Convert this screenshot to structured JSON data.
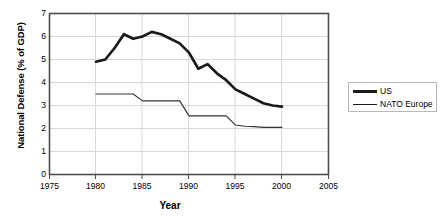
{
  "chart_data": {
    "type": "line",
    "title": "",
    "xlabel": "Year",
    "ylabel": "National Defense (% of GDP)",
    "xlim": [
      1975,
      2005
    ],
    "ylim": [
      0,
      7
    ],
    "xticks": [
      1975,
      1980,
      1985,
      1990,
      1995,
      2000,
      2005
    ],
    "yticks": [
      0,
      1,
      2,
      3,
      4,
      5,
      6,
      7
    ],
    "grid": true,
    "legend_position": "right",
    "x": [
      1980,
      1981,
      1982,
      1983,
      1984,
      1985,
      1986,
      1987,
      1988,
      1989,
      1990,
      1991,
      1992,
      1993,
      1994,
      1995,
      1996,
      1997,
      1998,
      1999,
      2000
    ],
    "series": [
      {
        "name": "US",
        "style": "thick",
        "color": "#1a1a1a",
        "values": [
          4.9,
          5.0,
          5.5,
          6.1,
          5.9,
          6.0,
          6.2,
          6.1,
          5.9,
          5.7,
          5.3,
          4.6,
          4.8,
          4.4,
          4.1,
          3.7,
          3.5,
          3.3,
          3.1,
          3.0,
          2.95
        ]
      },
      {
        "name": "NATO Europe",
        "style": "thin",
        "color": "#333333",
        "values": [
          3.5,
          3.5,
          3.5,
          3.5,
          3.5,
          3.2,
          3.2,
          3.2,
          3.2,
          3.2,
          2.55,
          2.55,
          2.55,
          2.55,
          2.55,
          2.15,
          2.1,
          2.08,
          2.05,
          2.05,
          2.05
        ]
      }
    ]
  },
  "axes": {
    "y_title": "National Defense (% of GDP)",
    "x_title": "Year",
    "y_tick_labels": [
      "7",
      "6",
      "5",
      "4",
      "3",
      "2",
      "1",
      "0"
    ],
    "x_tick_labels": [
      "1975",
      "1980",
      "1985",
      "1990",
      "1995",
      "2000",
      "2005"
    ]
  },
  "legend": {
    "entries": [
      {
        "label": "US"
      },
      {
        "label": "NATO Europe"
      }
    ]
  },
  "colors": {
    "line": "#1a1a1a",
    "grid": "#d9d9d9",
    "frame": "#4d4d4d",
    "legend_border": "#b8b8b8",
    "background": "#ffffff"
  }
}
